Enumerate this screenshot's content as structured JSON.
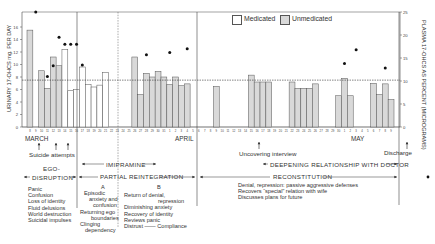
{
  "chart_data": {
    "type": "bar",
    "title": "",
    "ylabel": "URINARY 17-OHCS mg. PER DAY",
    "y2label": "PLASMA 17-OHCS AS PERCENT (MICROGRAMS)",
    "ylim": [
      0,
      18
    ],
    "y2lim": [
      0,
      25
    ],
    "yticks": [
      0,
      2,
      4,
      6,
      8,
      10,
      12,
      14,
      16
    ],
    "y2ticks": [
      0,
      5,
      10,
      15,
      20,
      25
    ],
    "reference_line_urinary": 7.5,
    "legend": {
      "position": "top-right",
      "entries": [
        "Medicated",
        "Unmedicated"
      ]
    },
    "months": [
      "MARCH",
      "APRIL",
      "MAY"
    ],
    "bars": [
      {
        "x": 8,
        "value": 15.5,
        "type": "Unmedicated"
      },
      {
        "x": 10,
        "value": 9.0,
        "type": "Unmedicated"
      },
      {
        "x": 11,
        "value": 6.2,
        "type": "Unmedicated"
      },
      {
        "x": 12,
        "value": 11.2,
        "type": "Unmedicated"
      },
      {
        "x": 13,
        "value": 9.8,
        "type": "Unmedicated"
      },
      {
        "x": 14,
        "value": 12.4,
        "type": "Medicated"
      },
      {
        "x": 15,
        "value": 5.8,
        "type": "Medicated"
      },
      {
        "x": 16,
        "value": 6.0,
        "type": "Medicated"
      },
      {
        "x": 17,
        "value": 9.6,
        "type": "Medicated"
      },
      {
        "x": 18,
        "value": 6.8,
        "type": "Medicated"
      },
      {
        "x": 19,
        "value": 6.4,
        "type": "Medicated"
      },
      {
        "x": 20,
        "value": 6.7,
        "type": "Medicated"
      },
      {
        "x": 21,
        "value": 8.7,
        "type": "Medicated"
      },
      {
        "x": 26,
        "value": 11.2,
        "type": "Unmedicated"
      },
      {
        "x": 27,
        "value": 5.2,
        "type": "Unmedicated"
      },
      {
        "x": 28,
        "value": 8.6,
        "type": "Unmedicated"
      },
      {
        "x": 29,
        "value": 8.0,
        "type": "Unmedicated"
      },
      {
        "x": 30,
        "value": 8.9,
        "type": "Unmedicated"
      },
      {
        "x": 31,
        "value": 8.0,
        "type": "Unmedicated"
      },
      {
        "x": "Apr 1",
        "value": 6.8,
        "type": "Unmedicated"
      },
      {
        "x": "Apr 2",
        "value": 8.0,
        "type": "Unmedicated"
      },
      {
        "x": "Apr 3",
        "value": 6.6,
        "type": "Unmedicated"
      },
      {
        "x": "Apr 4",
        "value": 6.9,
        "type": "Unmedicated"
      },
      {
        "x": "Apr 9",
        "value": 6.5,
        "type": "Unmedicated"
      },
      {
        "x": "Apr 15",
        "value": 8.3,
        "type": "Unmedicated"
      },
      {
        "x": "Apr 16",
        "value": 7.2,
        "type": "Unmedicated"
      },
      {
        "x": "Apr 17",
        "value": 7.2,
        "type": "Unmedicated"
      },
      {
        "x": "Apr 18",
        "value": 7.2,
        "type": "Unmedicated"
      },
      {
        "x": "Apr 22",
        "value": 7.2,
        "type": "Unmedicated"
      },
      {
        "x": "Apr 23",
        "value": 6.2,
        "type": "Unmedicated"
      },
      {
        "x": "Apr 24",
        "value": 6.2,
        "type": "Unmedicated"
      },
      {
        "x": "Apr 25",
        "value": 6.2,
        "type": "Unmedicated"
      },
      {
        "x": "Apr 26",
        "value": 6.9,
        "type": "Unmedicated"
      },
      {
        "x": "Apr 30",
        "value": 5.0,
        "type": "Unmedicated"
      },
      {
        "x": "May 1",
        "value": 7.8,
        "type": "Unmedicated"
      },
      {
        "x": "May 2",
        "value": 5.0,
        "type": "Unmedicated"
      },
      {
        "x": "May 6",
        "value": 7.0,
        "type": "Unmedicated"
      },
      {
        "x": "May 7",
        "value": 5.2,
        "type": "Unmedicated"
      },
      {
        "x": "May 8",
        "value": 6.9,
        "type": "Unmedicated"
      },
      {
        "x": "May 9",
        "value": 4.4,
        "type": "Unmedicated"
      }
    ],
    "plasma_points": [
      {
        "x": 9,
        "value": 25
      },
      {
        "x": 11,
        "value": 11
      },
      {
        "x": 12,
        "value": 13.3
      },
      {
        "x": 13,
        "value": 19.5
      },
      {
        "x": 14,
        "value": 18
      },
      {
        "x": 15,
        "value": 18
      },
      {
        "x": 16,
        "value": 18
      },
      {
        "x": 17,
        "value": 13.5
      },
      {
        "x": 28,
        "value": 15.7
      },
      {
        "x": "Apr 1",
        "value": 16.2
      },
      {
        "x": "Apr 4",
        "value": 17
      },
      {
        "x": "May 1",
        "value": 13.8
      },
      {
        "x": "May 3",
        "value": 16.8
      },
      {
        "x": "May 8",
        "value": 12.8
      }
    ]
  },
  "axis": {
    "left_label": "URINARY 17-OHCS mg. PER DAY",
    "right_label": "PLASMA 17-OHCS AS PERCENT (MICROGRAMS)",
    "left_ticks": [
      "0",
      "2",
      "4",
      "6",
      "8",
      "10",
      "12",
      "14",
      "16"
    ],
    "right_ticks": [
      "0",
      "5",
      "10",
      "15",
      "20",
      "25"
    ],
    "months": {
      "march": "MARCH",
      "april": "APRIL",
      "may": "MAY"
    }
  },
  "legend": {
    "medicated": "Medicated",
    "unmedicated": "Unmedicated"
  },
  "annotations": {
    "suicide_attempts": "Suicide attempts",
    "uncovering_interview": "Uncovering interview",
    "discharge": "Discharge",
    "ego_disruption_1": "EGO-",
    "ego_disruption_2": "DISRUPTION",
    "imipramine": "IMIPRAMINE",
    "partial_reintegration": "PARTIAL  REINTEGRATION",
    "deepening": "DEEPENING RELATIONSHIP WITH DOCTOR",
    "reconstitution": "RECONSTITUTION",
    "phase_a": "A",
    "phase_b": "B",
    "ego_list": [
      "Panic",
      "Confusion",
      "Loss of identity",
      "Fluid delusions",
      "World destruction",
      "Suicidal impulses"
    ],
    "partial_a_list": [
      "Episodic",
      "anxiety and",
      "confusion",
      "Returning ego",
      "boundaries",
      "Clinging",
      "dependency"
    ],
    "partial_b_list": [
      "Return of denial,",
      "repression",
      "Diminishing anxiety",
      "Recovery of identity",
      "Reviews panic",
      "Distrust —— Compliance"
    ],
    "recon_list": [
      "Denial, repression: passive aggressive defenses",
      "Recovers “special” relation with wife",
      "Discusses plans for future"
    ]
  },
  "colors": {
    "unmedicated_fill": "#d9d9d9",
    "medicated_fill": "#ffffff",
    "line": "#333333",
    "dot": "#111111"
  }
}
